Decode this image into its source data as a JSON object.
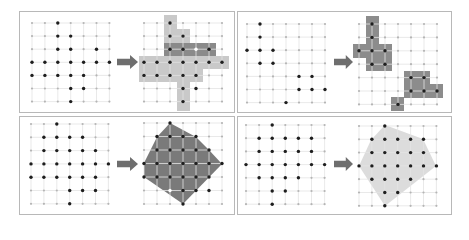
{
  "figure": {
    "width": 469,
    "height": 224,
    "colors": {
      "background": "#ffffff",
      "panel_border": "#b8b8b8",
      "grid_line": "#e3e3e3",
      "grid_node": "#b5b5b5",
      "dot": "#1e1e1e",
      "highlight_dot": "#ffffff",
      "arrow": "#6e6e6e",
      "light_fill": "#c9c9c9",
      "dark_fill": "#8a8a8a",
      "medium_fill": "#8c8c8c",
      "polygon_dark": "#7a7a7a",
      "polygon_light": "#dcdcdc"
    },
    "grid": {
      "cols": 7,
      "rows": 7
    },
    "panels": [
      {
        "id": "top-left",
        "name": "row-column-expansion-example",
        "box": {
          "x": 19,
          "y": 11,
          "w": 215,
          "h": 101
        },
        "arrow": {
          "x": 117,
          "y": 56,
          "w": 21,
          "h": 12
        },
        "before": {
          "origin": {
            "x": 32,
            "y": 23
          },
          "step": {
            "x": 12.9,
            "y": 13.1
          },
          "dots": [
            [
              0,
              2
            ],
            [
              1,
              2
            ],
            [
              1,
              3
            ],
            [
              2,
              2
            ],
            [
              2,
              3
            ],
            [
              2,
              5
            ],
            [
              3,
              0
            ],
            [
              3,
              1
            ],
            [
              3,
              2
            ],
            [
              3,
              3
            ],
            [
              3,
              4
            ],
            [
              3,
              5
            ],
            [
              3,
              6
            ],
            [
              4,
              0
            ],
            [
              4,
              1
            ],
            [
              4,
              2
            ],
            [
              4,
              3
            ],
            [
              4,
              4
            ],
            [
              5,
              3
            ],
            [
              5,
              4
            ],
            [
              6,
              3
            ]
          ]
        },
        "after": {
          "origin": {
            "x": 144,
            "y": 23
          },
          "step": {
            "x": 13.0,
            "y": 13.1
          },
          "rects": [
            {
              "x": 164,
              "y": 15,
              "w": 13,
              "h": 30,
              "fill": "light_fill"
            },
            {
              "x": 177,
              "y": 29,
              "w": 13,
              "h": 16,
              "fill": "light_fill"
            },
            {
              "x": 139,
              "y": 56,
              "w": 90,
              "h": 13,
              "fill": "light_fill"
            },
            {
              "x": 139,
              "y": 69,
              "w": 64,
              "h": 13,
              "fill": "light_fill"
            },
            {
              "x": 177,
              "y": 82,
              "w": 13,
              "h": 29,
              "fill": "light_fill"
            },
            {
              "x": 164,
              "y": 43,
              "w": 52,
              "h": 13,
              "fill": "dark_fill"
            }
          ],
          "dots": [
            [
              0,
              2
            ],
            [
              1,
              2
            ],
            [
              1,
              3
            ],
            [
              2,
              2
            ],
            [
              2,
              3
            ],
            [
              2,
              5
            ],
            [
              3,
              0
            ],
            [
              3,
              1
            ],
            [
              3,
              2
            ],
            [
              3,
              3
            ],
            [
              3,
              4
            ],
            [
              3,
              5
            ],
            [
              3,
              6
            ],
            [
              4,
              0
            ],
            [
              4,
              1
            ],
            [
              4,
              2
            ],
            [
              4,
              3
            ],
            [
              4,
              4
            ],
            [
              5,
              3
            ],
            [
              5,
              4
            ],
            [
              6,
              3
            ]
          ],
          "white_dots": [
            [
              2,
              4
            ]
          ]
        }
      },
      {
        "id": "top-right",
        "name": "connected-components-example",
        "box": {
          "x": 237,
          "y": 11,
          "w": 214,
          "h": 101
        },
        "arrow": {
          "x": 334,
          "y": 56,
          "w": 19,
          "h": 12
        },
        "before": {
          "origin": {
            "x": 247,
            "y": 24
          },
          "step": {
            "x": 13.0,
            "y": 13.1
          },
          "dots": [
            [
              0,
              1
            ],
            [
              1,
              1
            ],
            [
              2,
              0
            ],
            [
              2,
              1
            ],
            [
              2,
              2
            ],
            [
              3,
              1
            ],
            [
              3,
              2
            ],
            [
              4,
              4
            ],
            [
              4,
              5
            ],
            [
              5,
              4
            ],
            [
              5,
              5
            ],
            [
              5,
              6
            ],
            [
              6,
              3
            ]
          ]
        },
        "after": {
          "origin": {
            "x": 359,
            "y": 24
          },
          "step": {
            "x": 13.0,
            "y": 13.4
          },
          "rects": [
            {
              "x": 366,
              "y": 16,
              "w": 13,
              "h": 28,
              "fill": "medium_fill"
            },
            {
              "x": 353,
              "y": 44,
              "w": 39,
              "h": 14,
              "fill": "medium_fill"
            },
            {
              "x": 366,
              "y": 58,
              "w": 26,
              "h": 13,
              "fill": "medium_fill"
            },
            {
              "x": 404,
              "y": 71,
              "w": 26,
              "h": 27,
              "fill": "medium_fill"
            },
            {
              "x": 430,
              "y": 84,
              "w": 13,
              "h": 14,
              "fill": "medium_fill"
            },
            {
              "x": 391,
              "y": 97,
              "w": 13,
              "h": 14,
              "fill": "medium_fill"
            }
          ],
          "dots": [
            [
              0,
              1
            ],
            [
              1,
              1
            ],
            [
              2,
              0
            ],
            [
              2,
              1
            ],
            [
              2,
              2
            ],
            [
              3,
              1
            ],
            [
              3,
              2
            ],
            [
              4,
              4
            ],
            [
              4,
              5
            ],
            [
              5,
              4
            ],
            [
              5,
              5
            ],
            [
              5,
              6
            ],
            [
              6,
              3
            ]
          ],
          "white_dots": []
        }
      },
      {
        "id": "bottom-left",
        "name": "convex-hull-dark-example",
        "box": {
          "x": 19,
          "y": 116,
          "w": 215,
          "h": 98
        },
        "arrow": {
          "x": 117,
          "y": 158,
          "w": 21,
          "h": 12
        },
        "before": {
          "origin": {
            "x": 31,
            "y": 124
          },
          "step": {
            "x": 12.9,
            "y": 13.3
          },
          "dots": [
            [
              0,
              2
            ],
            [
              1,
              1
            ],
            [
              1,
              2
            ],
            [
              1,
              3
            ],
            [
              1,
              4
            ],
            [
              2,
              1
            ],
            [
              2,
              2
            ],
            [
              2,
              3
            ],
            [
              2,
              4
            ],
            [
              2,
              5
            ],
            [
              3,
              0
            ],
            [
              3,
              1
            ],
            [
              3,
              2
            ],
            [
              3,
              3
            ],
            [
              3,
              4
            ],
            [
              3,
              5
            ],
            [
              3,
              6
            ],
            [
              4,
              0
            ],
            [
              4,
              1
            ],
            [
              4,
              2
            ],
            [
              4,
              3
            ],
            [
              4,
              4
            ],
            [
              4,
              5
            ],
            [
              5,
              3
            ],
            [
              5,
              4
            ],
            [
              5,
              5
            ],
            [
              6,
              3
            ]
          ]
        },
        "after": {
          "origin": {
            "x": 144,
            "y": 123
          },
          "step": {
            "x": 13.0,
            "y": 13.5
          },
          "polygon": {
            "points": [
              [
                170,
                123
              ],
              [
                196,
                137
              ],
              [
                209,
                150
              ],
              [
                222,
                164
              ],
              [
                183,
                204
              ],
              [
                144,
                177
              ],
              [
                144,
                163
              ],
              [
                157,
                137
              ]
            ],
            "fill": "polygon_dark"
          },
          "dots": [
            [
              0,
              2
            ],
            [
              1,
              1
            ],
            [
              1,
              2
            ],
            [
              1,
              3
            ],
            [
              1,
              4
            ],
            [
              2,
              1
            ],
            [
              2,
              2
            ],
            [
              2,
              3
            ],
            [
              2,
              4
            ],
            [
              2,
              5
            ],
            [
              3,
              0
            ],
            [
              3,
              1
            ],
            [
              3,
              2
            ],
            [
              3,
              3
            ],
            [
              3,
              4
            ],
            [
              3,
              5
            ],
            [
              3,
              6
            ],
            [
              4,
              0
            ],
            [
              4,
              1
            ],
            [
              4,
              2
            ],
            [
              4,
              3
            ],
            [
              4,
              4
            ],
            [
              4,
              5
            ],
            [
              5,
              3
            ],
            [
              5,
              4
            ],
            [
              5,
              5
            ],
            [
              6,
              3
            ]
          ],
          "white_dots": [
            [
              5,
              2
            ]
          ]
        }
      },
      {
        "id": "bottom-right",
        "name": "convex-hull-light-example",
        "box": {
          "x": 237,
          "y": 116,
          "w": 214,
          "h": 98
        },
        "arrow": {
          "x": 334,
          "y": 158,
          "w": 19,
          "h": 12
        },
        "before": {
          "origin": {
            "x": 246,
            "y": 125
          },
          "step": {
            "x": 13.1,
            "y": 13.2
          },
          "dots": [
            [
              0,
              2
            ],
            [
              1,
              1
            ],
            [
              1,
              2
            ],
            [
              1,
              3
            ],
            [
              1,
              4
            ],
            [
              1,
              5
            ],
            [
              2,
              1
            ],
            [
              2,
              2
            ],
            [
              2,
              3
            ],
            [
              2,
              4
            ],
            [
              2,
              5
            ],
            [
              3,
              0
            ],
            [
              3,
              1
            ],
            [
              3,
              2
            ],
            [
              3,
              3
            ],
            [
              3,
              4
            ],
            [
              3,
              5
            ],
            [
              3,
              6
            ],
            [
              4,
              1
            ],
            [
              4,
              2
            ],
            [
              4,
              3
            ],
            [
              4,
              4
            ],
            [
              5,
              2
            ],
            [
              5,
              3
            ],
            [
              6,
              2
            ]
          ]
        },
        "after": {
          "origin": {
            "x": 359,
            "y": 126
          },
          "step": {
            "x": 12.9,
            "y": 13.3
          },
          "polygon": {
            "points": [
              [
                385,
                125
              ],
              [
                423,
                139
              ],
              [
                436,
                166
              ],
              [
                385,
                206
              ],
              [
                359,
                166
              ],
              [
                371,
                140
              ]
            ],
            "fill": "polygon_light"
          },
          "dots": [
            [
              0,
              2
            ],
            [
              1,
              1
            ],
            [
              1,
              2
            ],
            [
              1,
              3
            ],
            [
              1,
              4
            ],
            [
              1,
              5
            ],
            [
              2,
              1
            ],
            [
              2,
              2
            ],
            [
              2,
              3
            ],
            [
              2,
              4
            ],
            [
              2,
              5
            ],
            [
              3,
              0
            ],
            [
              3,
              1
            ],
            [
              3,
              2
            ],
            [
              3,
              3
            ],
            [
              3,
              4
            ],
            [
              3,
              5
            ],
            [
              3,
              6
            ],
            [
              4,
              1
            ],
            [
              4,
              2
            ],
            [
              4,
              3
            ],
            [
              4,
              4
            ],
            [
              5,
              2
            ],
            [
              5,
              3
            ],
            [
              6,
              2
            ]
          ],
          "white_dots": []
        }
      }
    ]
  }
}
